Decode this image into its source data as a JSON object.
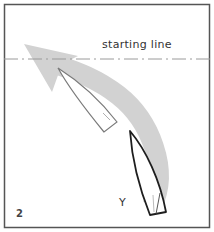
{
  "diagram": {
    "panel_number": "2",
    "start_line_label": "starting line",
    "boat_label": "Y",
    "colors": {
      "frame": "#555555",
      "arrow": "#cfcfcf",
      "start_line": "#999999",
      "boat_outline": "#222222",
      "ghost_outline": "#777777"
    }
  }
}
